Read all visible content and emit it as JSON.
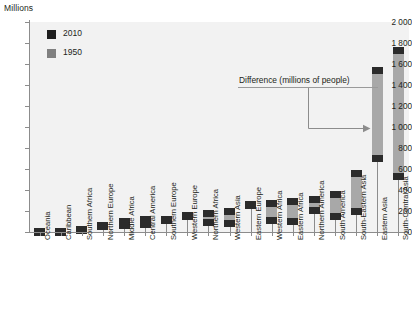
{
  "chart_data": {
    "type": "bar",
    "title": "",
    "subtitle": "",
    "ylabel": "Millions",
    "xlabel": "",
    "ylim": [
      0,
      2000
    ],
    "ytick_values": [
      0,
      200,
      400,
      600,
      800,
      1000,
      1200,
      1400,
      1600,
      1800,
      2000
    ],
    "ytick_labels": [
      "0",
      "200",
      "400",
      "600",
      "800",
      "1 000",
      "1 200",
      "1 400",
      "1 600",
      "1 800",
      "2 000"
    ],
    "grid": false,
    "legend_position": "top-left",
    "legend": [
      "2010",
      "1950"
    ],
    "annotation": "Difference (millions of people)",
    "note": "Floating bars: lower dark cap = 1950 population, upper dark cap = 2010 population, light grey span between = difference.",
    "categories": [
      "Oceania",
      "Caribbean",
      "Southern Africa",
      "Northern Europe",
      "Middle Africa",
      "Central America",
      "Southern Europe",
      "Western Europe",
      "Northern Africa",
      "Western Asia",
      "Eastern Europe",
      "Western Africa",
      "Eastern Africa",
      "Northern America",
      "South America",
      "South-Eastern Asia",
      "Eastern Asia",
      "South-Central Asia"
    ],
    "series": [
      {
        "name": "1950",
        "color": "#2b2b2b",
        "values": [
          13,
          17,
          16,
          78,
          26,
          38,
          109,
          141,
          53,
          51,
          221,
          73,
          66,
          172,
          114,
          165,
          671,
          499
        ]
      },
      {
        "name": "2010",
        "color": "#2b2b2b",
        "values": [
          37,
          42,
          58,
          99,
          129,
          155,
          155,
          189,
          206,
          232,
          295,
          304,
          324,
          345,
          393,
          593,
          1574,
          1764
        ]
      }
    ],
    "differences": [
      24,
      25,
      42,
      21,
      103,
      117,
      46,
      48,
      153,
      181,
      74,
      231,
      258,
      173,
      279,
      428,
      903,
      1265
    ]
  },
  "colors": {
    "bar_fill": "#a8a8a8",
    "cap": "#2b2b2b",
    "plot_background": "#f2f2f2",
    "axis": "#8c8c8c",
    "text": "#231f20",
    "legend_2010": "#1f1f1f",
    "legend_1950": "#808080"
  }
}
